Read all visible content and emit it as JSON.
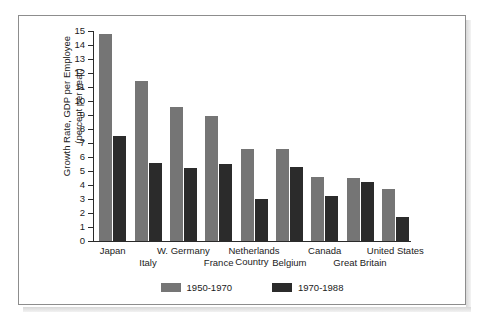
{
  "chart_data": {
    "type": "bar",
    "title": "",
    "xlabel": "Country",
    "ylabel": "Growth Rate, GDP per Employee (percent per year)",
    "ylabel_line1": "Growth Rate, GDP per Employee",
    "ylabel_line2": "(percent per year)",
    "ylim": [
      0,
      15
    ],
    "yticks": [
      0,
      1,
      2,
      3,
      4,
      5,
      6,
      7,
      8,
      9,
      10,
      11,
      12,
      13,
      14,
      15
    ],
    "ytick_labels": [
      "0",
      "1",
      "2",
      "3",
      "4",
      "5",
      "6",
      "7",
      "8",
      "9",
      "10",
      "11",
      "12",
      "13",
      "14",
      "15"
    ],
    "grid": false,
    "legend_position": "bottom",
    "categories": [
      "Japan",
      "Italy",
      "W. Germany",
      "France",
      "Netherlands",
      "Belgium",
      "Canada",
      "Great Britain",
      "United States"
    ],
    "series": [
      {
        "name": "1950-1970",
        "color": "#757575",
        "values": [
          14.8,
          11.4,
          9.6,
          8.9,
          6.6,
          6.6,
          4.6,
          4.5,
          3.7
        ]
      },
      {
        "name": "1970-1988",
        "color": "#2b2b2b",
        "values": [
          7.5,
          5.6,
          5.2,
          5.5,
          3.0,
          5.3,
          3.25,
          4.2,
          1.7
        ]
      }
    ]
  },
  "legend": {
    "items": [
      {
        "label": "1950-1970",
        "color": "#757575"
      },
      {
        "label": "1970-1988",
        "color": "#2b2b2b"
      }
    ]
  },
  "colors": {
    "series1": "#757575",
    "series2": "#2b2b2b",
    "axis": "#2a2a2a",
    "frame": "#8d8d8d",
    "background": "#ffffff"
  }
}
